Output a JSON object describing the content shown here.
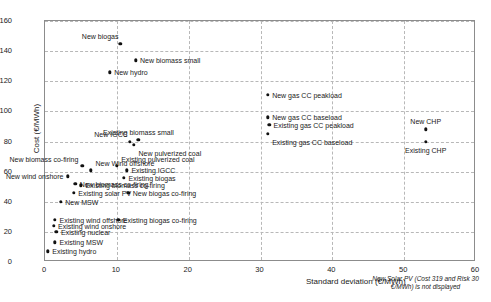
{
  "chart_data": {
    "type": "scatter",
    "title": "",
    "xlabel": "Standard deviation (€/MWh)",
    "ylabel": "Cost (€/MWh)",
    "xlim": [
      0,
      60
    ],
    "ylim": [
      0,
      160
    ],
    "xticks": [
      0,
      10,
      20,
      30,
      40,
      50,
      60
    ],
    "yticks": [
      0,
      20,
      40,
      60,
      80,
      100,
      120,
      140,
      160
    ],
    "grid": true,
    "legend": false,
    "annotation": "New Solar PV (Cost 319 and Risk 30 €/MWh) is not displayed",
    "points": [
      {
        "label": "New biogas",
        "x": 10.5,
        "y": 145,
        "pos": "above-left"
      },
      {
        "label": "New biomass small",
        "x": 12.6,
        "y": 134,
        "pos": "right"
      },
      {
        "label": "New hydro",
        "x": 9.0,
        "y": 126,
        "pos": "right"
      },
      {
        "label": "New gas CC peakload",
        "x": 31.0,
        "y": 111,
        "pos": "right"
      },
      {
        "label": "New gas CC baseload",
        "x": 31.0,
        "y": 96,
        "pos": "right"
      },
      {
        "label": "Existing gas CC peakload",
        "x": 31.2,
        "y": 91,
        "pos": "right"
      },
      {
        "label": "Existing gas CC baseload",
        "x": 31.0,
        "y": 85,
        "pos": "right-below"
      },
      {
        "label": "New CHP",
        "x": 53.0,
        "y": 88,
        "pos": "above"
      },
      {
        "label": "Existing CHP",
        "x": 53.0,
        "y": 80,
        "pos": "below"
      },
      {
        "label": "New IGCC",
        "x": 11.8,
        "y": 80,
        "pos": "above-left"
      },
      {
        "label": "Existing biomass small",
        "x": 13.0,
        "y": 81,
        "pos": "above"
      },
      {
        "label": "New pulverized coal",
        "x": 12.4,
        "y": 78,
        "pos": "right-below"
      },
      {
        "label": "New biomass co-firing",
        "x": 5.2,
        "y": 64,
        "pos": "left-above"
      },
      {
        "label": "Existing pulverized coal",
        "x": 10.0,
        "y": 64,
        "pos": "right-above"
      },
      {
        "label": "New Wind offshore",
        "x": 6.4,
        "y": 61,
        "pos": "right-above"
      },
      {
        "label": "Existing IGCC",
        "x": 11.4,
        "y": 61,
        "pos": "right"
      },
      {
        "label": "New wind onshore",
        "x": 3.2,
        "y": 57,
        "pos": "left"
      },
      {
        "label": "Existing biogas",
        "x": 11.0,
        "y": 56,
        "pos": "right"
      },
      {
        "label": "New biomass co-firing 2",
        "x": 4.2,
        "y": 52,
        "pos": "right"
      },
      {
        "label": "Existing biomass co-firing",
        "x": 5.0,
        "y": 51,
        "pos": "right"
      },
      {
        "label": "Existing solar PV",
        "x": 4.0,
        "y": 46,
        "pos": "right"
      },
      {
        "label": "New biogas co-firing",
        "x": 11.6,
        "y": 46,
        "pos": "right"
      },
      {
        "label": "New MSW",
        "x": 2.2,
        "y": 40,
        "pos": "right"
      },
      {
        "label": "Existing wind offshore",
        "x": 1.4,
        "y": 28,
        "pos": "right"
      },
      {
        "label": "Existing biogas co-firing",
        "x": 10.2,
        "y": 28,
        "pos": "right"
      },
      {
        "label": "Existing wind onshore",
        "x": 1.2,
        "y": 24,
        "pos": "right"
      },
      {
        "label": "Existing nuclear",
        "x": 1.6,
        "y": 20,
        "pos": "right"
      },
      {
        "label": "Existing MSW",
        "x": 1.4,
        "y": 13,
        "pos": "right"
      },
      {
        "label": "Existing hydro",
        "x": 0.4,
        "y": 7,
        "pos": "right"
      }
    ]
  },
  "axes": {
    "y_tick_labels": [
      "0",
      "20",
      "40",
      "60",
      "80",
      "100",
      "120",
      "140",
      "160"
    ],
    "x_tick_labels": [
      "0",
      "10",
      "20",
      "30",
      "40",
      "50",
      "60"
    ],
    "y_axis_title": "Cost (€/MWh)",
    "x_axis_title": "Standard deviation (€/MWh)"
  },
  "footnote": {
    "line1": "New Solar PV (Cost 319 and Risk 30",
    "line2": "€/MWh) is not displayed"
  },
  "style": {
    "marker_color": "#111111",
    "grid_color": "#b8b8b8",
    "frame_color": "#8c8c8c",
    "text_color": "#1a1a1a"
  }
}
